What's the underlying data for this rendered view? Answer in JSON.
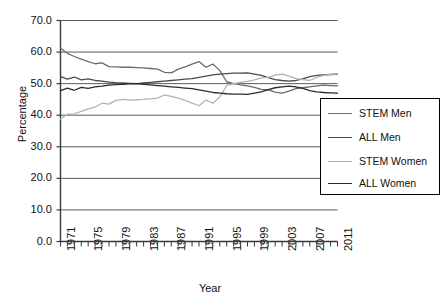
{
  "chart_data": {
    "type": "line",
    "title": "",
    "xlabel": "Year",
    "ylabel": "Percentage",
    "xlim": [
      1971,
      2011
    ],
    "ylim": [
      0.0,
      70.0
    ],
    "yticks": [
      "0.0",
      "10.0",
      "20.0",
      "30.0",
      "40.0",
      "50.0",
      "60.0",
      "70.0"
    ],
    "xticks": [
      "1971",
      "1975",
      "1979",
      "1983",
      "1987",
      "1991",
      "1995",
      "1999",
      "2003",
      "2007",
      "2011"
    ],
    "grid": "horizontal",
    "legend_position": "right",
    "x": [
      1971,
      1972,
      1973,
      1974,
      1975,
      1976,
      1977,
      1978,
      1979,
      1980,
      1981,
      1982,
      1983,
      1984,
      1985,
      1986,
      1987,
      1988,
      1989,
      1990,
      1991,
      1992,
      1993,
      1994,
      1995,
      1996,
      1997,
      1998,
      1999,
      2000,
      2001,
      2002,
      2003,
      2004,
      2005,
      2006,
      2007,
      2008,
      2009,
      2010,
      2011
    ],
    "series": [
      {
        "name": "STEM Men",
        "color": "#6b6b6b",
        "values": [
          61.2,
          59.6,
          58.6,
          57.8,
          57.0,
          56.3,
          56.6,
          55.4,
          55.3,
          55.2,
          55.2,
          55.1,
          55.0,
          54.8,
          54.6,
          53.6,
          53.4,
          54.6,
          55.3,
          56.2,
          57.0,
          55.2,
          56.2,
          54.2,
          50.6,
          50.0,
          49.6,
          49.3,
          48.8,
          48.2,
          48.0,
          47.3,
          47.0,
          47.6,
          48.4,
          48.7,
          49.0,
          49.3,
          49.5,
          49.4,
          49.3
        ]
      },
      {
        "name": "ALL Men",
        "color": "#4a4a4a",
        "values": [
          52.2,
          51.4,
          52.1,
          51.2,
          51.5,
          51.0,
          50.8,
          50.5,
          50.3,
          50.2,
          50.1,
          50.0,
          50.2,
          50.4,
          50.6,
          50.8,
          51.0,
          51.2,
          51.4,
          51.6,
          52.0,
          52.4,
          52.8,
          53.0,
          53.2,
          53.3,
          53.3,
          53.4,
          53.0,
          52.6,
          51.9,
          51.3,
          51.0,
          50.8,
          51.0,
          51.5,
          52.2,
          52.6,
          52.8,
          52.9,
          53.0
        ]
      },
      {
        "name": "STEM Women",
        "color": "#b4b4b4",
        "values": [
          38.8,
          40.3,
          40.4,
          41.2,
          42.0,
          42.6,
          43.8,
          43.5,
          44.7,
          45.0,
          44.8,
          44.9,
          45.0,
          45.2,
          45.4,
          46.4,
          46.0,
          45.4,
          44.7,
          43.8,
          43.0,
          44.8,
          43.8,
          45.8,
          49.4,
          50.0,
          50.4,
          50.7,
          51.2,
          51.8,
          52.0,
          52.7,
          53.0,
          52.4,
          51.6,
          51.3,
          51.0,
          52.0,
          52.6,
          52.9,
          53.2
        ]
      },
      {
        "name": "ALL Women",
        "color": "#2c2c2c",
        "values": [
          47.8,
          48.6,
          47.9,
          48.8,
          48.5,
          49.0,
          49.2,
          49.5,
          49.7,
          49.8,
          49.9,
          50.0,
          49.8,
          49.6,
          49.4,
          49.2,
          49.0,
          48.8,
          48.6,
          48.4,
          48.0,
          47.6,
          47.2,
          47.0,
          46.8,
          46.7,
          46.7,
          46.6,
          47.0,
          47.4,
          48.1,
          48.7,
          49.0,
          49.2,
          49.0,
          48.5,
          47.8,
          47.4,
          47.2,
          47.1,
          47.0
        ]
      }
    ]
  },
  "legend": {
    "items": [
      {
        "label": "STEM Men"
      },
      {
        "label": "ALL Men"
      },
      {
        "label": "STEM Women"
      },
      {
        "label": "ALL Women"
      }
    ]
  }
}
